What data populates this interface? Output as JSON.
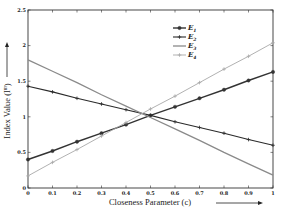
{
  "chart_data": {
    "type": "line",
    "title": "",
    "xlabel": "Closeness Parameter (c)",
    "ylabel": "Index Value (I^m)",
    "xlim": [
      0,
      1
    ],
    "ylim": [
      0,
      2.5
    ],
    "grid": false,
    "legend_position": "upper right",
    "x": [
      0,
      0.1,
      0.2,
      0.3,
      0.4,
      0.5,
      0.6,
      0.7,
      0.8,
      0.9,
      1
    ],
    "x_ticks": [
      "0",
      "0.1",
      "0.2",
      "0.3",
      "0.4",
      "0.5",
      "0.6",
      "0.7",
      "0.8",
      "0.9",
      "1"
    ],
    "y_ticks": [
      "0",
      "0.5",
      "1",
      "1.5",
      "2",
      "2.5"
    ],
    "series": [
      {
        "name": "E1",
        "color": "#333333",
        "width": 1.4,
        "marker": "circle",
        "values": [
          0.4,
          0.52,
          0.65,
          0.77,
          0.89,
          1.02,
          1.14,
          1.26,
          1.38,
          1.51,
          1.63
        ]
      },
      {
        "name": "E2",
        "color": "#2a2a2a",
        "width": 1.1,
        "marker": "plus",
        "values": [
          1.43,
          1.35,
          1.26,
          1.18,
          1.1,
          1.02,
          0.93,
          0.85,
          0.77,
          0.68,
          0.6
        ]
      },
      {
        "name": "E3",
        "color": "#8a8a8a",
        "width": 1.3,
        "marker": "none",
        "values": [
          1.8,
          1.64,
          1.48,
          1.31,
          1.15,
          0.99,
          0.83,
          0.67,
          0.5,
          0.34,
          0.18
        ]
      },
      {
        "name": "E4",
        "color": "#a8a8a8",
        "width": 0.9,
        "marker": "plus",
        "values": [
          0.17,
          0.36,
          0.54,
          0.73,
          0.92,
          1.11,
          1.29,
          1.48,
          1.67,
          1.85,
          2.04
        ]
      }
    ]
  },
  "labels": {
    "xlabel": "Closeness Parameter (c)",
    "ylabel": "Index Value (I",
    "ylabel_sup": "m",
    "ylabel_close": ")"
  }
}
